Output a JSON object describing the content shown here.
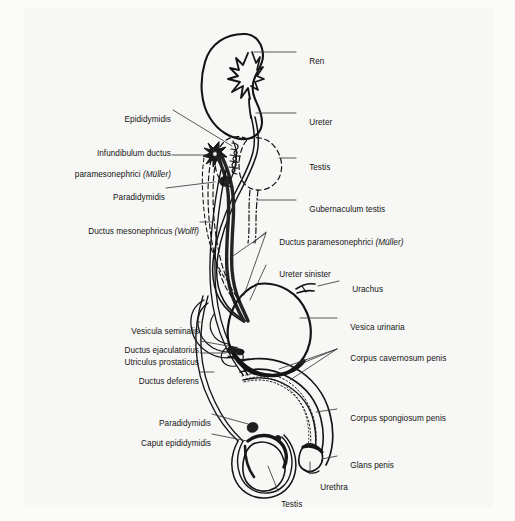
{
  "figure": {
    "background_color": "#f7f7f5",
    "ink_color": "#141414"
  },
  "labels": [
    {
      "id": "ren",
      "text": "Ren",
      "side": "right"
    },
    {
      "id": "epididymidis",
      "text": "Epididymidis",
      "side": "left"
    },
    {
      "id": "ureter",
      "text": "Ureter",
      "side": "right"
    },
    {
      "id": "infundibulum_l1",
      "text": "Infundibulum ductus",
      "side": "left"
    },
    {
      "id": "infundibulum_l2",
      "text": "paramesonephrici ",
      "side": "left",
      "italic_suffix": "(Müller)"
    },
    {
      "id": "testis_upper",
      "text": "Testis",
      "side": "right"
    },
    {
      "id": "paradidymidis_upper",
      "text": "Paradidymidis",
      "side": "left"
    },
    {
      "id": "gubernaculum_testis",
      "text": "Gubernaculum testis",
      "side": "right"
    },
    {
      "id": "ductus_mesonephricus",
      "text": "Ductus mesonephricus ",
      "side": "left",
      "italic_suffix": "(Wolff)"
    },
    {
      "id": "ductus_paramesonephrici",
      "text": "Ductus paramesonephrici ",
      "side": "right",
      "italic_suffix": "(Müller)"
    },
    {
      "id": "ureter_sinister",
      "text": "Ureter sinister",
      "side": "right"
    },
    {
      "id": "urachus",
      "text": "Urachus",
      "side": "right"
    },
    {
      "id": "vesicula_seminalis",
      "text": "Vesicula seminalis",
      "side": "left"
    },
    {
      "id": "vesica_urinaria",
      "text": "Vesica urinaria",
      "side": "right"
    },
    {
      "id": "ductus_ejaculatorius",
      "text": "Ductus ejaculatorius",
      "side": "left"
    },
    {
      "id": "utriculus_prostaticus",
      "text": "Utriculus prostaticus",
      "side": "left"
    },
    {
      "id": "corpus_cavernosum",
      "text": "Corpus cavernosum penis",
      "side": "right"
    },
    {
      "id": "ductus_deferens",
      "text": "Ductus deferens",
      "side": "left"
    },
    {
      "id": "corpus_spongiosum",
      "text": "Corpus spongiosum penis",
      "side": "right"
    },
    {
      "id": "paradidymidis_lower",
      "text": "Paradidymidis",
      "side": "left"
    },
    {
      "id": "caput_epididymidis",
      "text": "Caput epididymidis",
      "side": "left"
    },
    {
      "id": "glans_penis",
      "text": "Glans penis",
      "side": "right"
    },
    {
      "id": "urethra",
      "text": "Urethra",
      "side": "right"
    },
    {
      "id": "testis_lower",
      "text": "Testis",
      "side": "below"
    }
  ]
}
